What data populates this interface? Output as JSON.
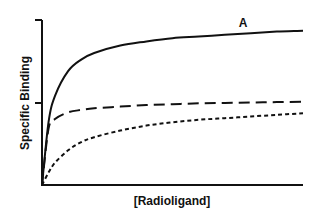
{
  "chart_data": {
    "type": "line",
    "title": "",
    "panel_label": "A",
    "xlabel": "[Radioligand]",
    "ylabel": "Specific Binding",
    "x_ticks": [],
    "y_ticks": [
      "0",
      "mid",
      "max"
    ],
    "ylim": [
      0,
      2
    ],
    "xlim": [
      0,
      10
    ],
    "grid": false,
    "legend": null,
    "x": [
      0,
      0.25,
      0.5,
      1,
      1.5,
      2,
      3,
      4,
      5,
      6,
      7,
      8,
      9,
      10
    ],
    "series": [
      {
        "name": "total (solid)",
        "style": "solid",
        "values": [
          0,
          0.76,
          1.08,
          1.38,
          1.52,
          1.6,
          1.69,
          1.74,
          1.78,
          1.8,
          1.82,
          1.84,
          1.86,
          1.87
        ]
      },
      {
        "name": "long-dash",
        "style": "long-dash",
        "values": [
          0,
          0.68,
          0.8,
          0.88,
          0.91,
          0.93,
          0.95,
          0.97,
          0.98,
          0.99,
          0.995,
          1.0,
          1.005,
          1.01
        ]
      },
      {
        "name": "short-dash",
        "style": "short-dash",
        "values": [
          0,
          0.15,
          0.27,
          0.42,
          0.52,
          0.58,
          0.66,
          0.72,
          0.76,
          0.79,
          0.81,
          0.83,
          0.85,
          0.87
        ]
      }
    ]
  }
}
